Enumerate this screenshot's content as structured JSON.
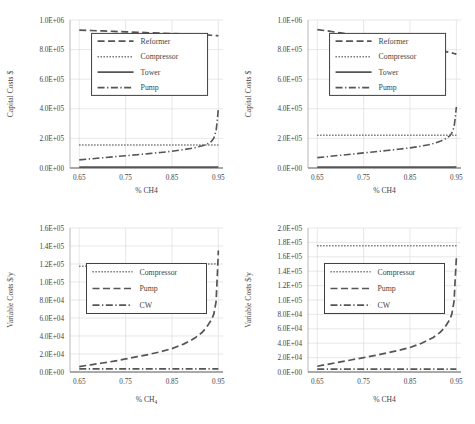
{
  "figure": {
    "panel_count": 4,
    "background": "#ffffff",
    "line_color": "#555555",
    "grid_color": "#d9d9d9",
    "axis_color": "#a6a6a6"
  },
  "chart_data": [
    {
      "id": "top-left",
      "type": "line",
      "title": "",
      "xlabel": "% CH4",
      "ylabel": "Capital Costs $",
      "xlim": [
        0.63,
        0.96
      ],
      "ylim": [
        0,
        1000000
      ],
      "xticks": [
        0.65,
        0.75,
        0.85,
        0.95
      ],
      "xticklabels": [
        "0.65",
        "0.75",
        "0.85",
        "0.95"
      ],
      "yticks": [
        0,
        200000,
        400000,
        600000,
        800000,
        1000000
      ],
      "yticklabels": [
        "0.0E+00",
        "2.0E+05",
        "4.0E+05",
        "6.0E+05",
        "8.0E+05",
        "1.0E+06"
      ],
      "grid": true,
      "legend_position": "upper-center",
      "legend": [
        "Reformer",
        "Compressor",
        "Tower",
        "Pump"
      ],
      "x": [
        0.65,
        0.675,
        0.7,
        0.725,
        0.75,
        0.775,
        0.8,
        0.825,
        0.85,
        0.875,
        0.89,
        0.9,
        0.915,
        0.925,
        0.935,
        0.94,
        0.945,
        0.948,
        0.95
      ],
      "series": [
        {
          "name": "Reformer",
          "dash": "dashed",
          "values": [
            932000,
            929000,
            926000,
            923000,
            920000,
            917000,
            914000,
            911000,
            908000,
            905000,
            903000,
            902000,
            900000,
            899000,
            897000,
            896000,
            895000,
            894000,
            893000
          ]
        },
        {
          "name": "Compressor",
          "dash": "dotted",
          "values": [
            155000,
            155000,
            155000,
            155000,
            155000,
            155000,
            155000,
            155000,
            155000,
            155000,
            155000,
            155000,
            155000,
            155000,
            155000,
            155000,
            155000,
            155000,
            155000
          ]
        },
        {
          "name": "Tower",
          "dash": "solid",
          "values": [
            6000,
            6000,
            6000,
            6000,
            6000,
            6000,
            6000,
            6000,
            6000,
            6000,
            6000,
            6000,
            6000,
            6000,
            6000,
            6000,
            6000,
            7000,
            8000
          ]
        },
        {
          "name": "Pump",
          "dash": "dashdot",
          "values": [
            55000,
            62000,
            69000,
            76000,
            83000,
            90000,
            97000,
            105000,
            113000,
            124000,
            132000,
            138000,
            150000,
            160000,
            180000,
            200000,
            250000,
            330000,
            405000
          ]
        }
      ]
    },
    {
      "id": "top-right",
      "type": "line",
      "title": "",
      "xlabel": "% CH4",
      "ylabel": "Capital Costs $",
      "xlim": [
        0.63,
        0.96
      ],
      "ylim": [
        0,
        1000000
      ],
      "xticks": [
        0.65,
        0.75,
        0.85,
        0.95
      ],
      "xticklabels": [
        "0.65",
        "0.75",
        "0.85",
        "0.95"
      ],
      "yticks": [
        0,
        200000,
        400000,
        600000,
        800000,
        1000000
      ],
      "yticklabels": [
        "0.0E+00",
        "2.0E+05",
        "4.0E+05",
        "6.0E+05",
        "8.0E+05",
        "1.0E+06"
      ],
      "grid": true,
      "legend_position": "upper-center",
      "legend": [
        "Reformer",
        "Compressor",
        "Tower",
        "Pump"
      ],
      "x": [
        0.65,
        0.675,
        0.7,
        0.725,
        0.75,
        0.775,
        0.8,
        0.825,
        0.85,
        0.875,
        0.89,
        0.9,
        0.915,
        0.925,
        0.935,
        0.94,
        0.945,
        0.948,
        0.95
      ],
      "series": [
        {
          "name": "Reformer",
          "dash": "dashed",
          "values": [
            935000,
            925000,
            913000,
            900000,
            887000,
            874000,
            861000,
            848000,
            834000,
            820000,
            811000,
            805000,
            795000,
            788000,
            781000,
            778000,
            774000,
            771000,
            768000
          ]
        },
        {
          "name": "Compressor",
          "dash": "dotted",
          "values": [
            222000,
            222000,
            222000,
            222000,
            222000,
            222000,
            222000,
            222000,
            222000,
            222000,
            222000,
            222000,
            222000,
            222000,
            222000,
            222000,
            222000,
            222000,
            222000
          ]
        },
        {
          "name": "Tower",
          "dash": "solid",
          "values": [
            6000,
            6000,
            6000,
            6000,
            6000,
            6000,
            6000,
            6000,
            6000,
            6000,
            6000,
            6000,
            6000,
            6000,
            6000,
            6000,
            6000,
            7000,
            8000
          ]
        },
        {
          "name": "Pump",
          "dash": "dashdot",
          "values": [
            70000,
            78000,
            86000,
            94000,
            102000,
            110000,
            118000,
            127000,
            136000,
            148000,
            157000,
            165000,
            180000,
            195000,
            215000,
            235000,
            275000,
            350000,
            412000
          ]
        }
      ]
    },
    {
      "id": "bottom-left",
      "type": "line",
      "title": "",
      "xlabel": "% CH₄",
      "ylabel": "Variable Costs $/y",
      "xlim": [
        0.63,
        0.96
      ],
      "ylim": [
        0,
        160000
      ],
      "xticks": [
        0.65,
        0.75,
        0.85,
        0.95
      ],
      "xticklabels": [
        "0.65",
        "0.75",
        "0.85",
        "0.95"
      ],
      "yticks": [
        0,
        20000,
        40000,
        60000,
        80000,
        100000,
        120000,
        140000,
        160000
      ],
      "yticklabels": [
        "0.0E+00",
        "2.0E+04",
        "4.0E+04",
        "6.0E+04",
        "8.0E+04",
        "1.0E+05",
        "1.2E+05",
        "1.4E+05",
        "1.6E+05"
      ],
      "grid": true,
      "legend_position": "center",
      "legend": [
        "Compressor",
        "Pump",
        "CW"
      ],
      "x": [
        0.65,
        0.675,
        0.7,
        0.725,
        0.75,
        0.775,
        0.8,
        0.825,
        0.85,
        0.875,
        0.89,
        0.9,
        0.915,
        0.925,
        0.935,
        0.94,
        0.945,
        0.948,
        0.95
      ],
      "series": [
        {
          "name": "Compressor",
          "dash": "dotted",
          "values": [
            117500,
            117700,
            117900,
            118100,
            118300,
            118500,
            118700,
            118900,
            119100,
            119300,
            119500,
            119600,
            119800,
            119900,
            120000,
            120100,
            120200,
            120300,
            120400
          ]
        },
        {
          "name": "Pump",
          "dash": "dashed",
          "values": [
            6000,
            8000,
            10000,
            12000,
            14500,
            17000,
            19500,
            22500,
            26000,
            31000,
            35000,
            38000,
            44000,
            50000,
            58000,
            64000,
            78000,
            110000,
            135000
          ]
        },
        {
          "name": "CW",
          "dash": "dashdot",
          "values": [
            3500,
            3500,
            3500,
            3500,
            3500,
            3500,
            3500,
            3500,
            3500,
            3500,
            3500,
            3500,
            3500,
            3500,
            3500,
            3500,
            3500,
            3500,
            3500
          ]
        }
      ]
    },
    {
      "id": "bottom-right",
      "type": "line",
      "title": "",
      "xlabel": "% CH4",
      "ylabel": "Variable Costs $/y",
      "xlim": [
        0.63,
        0.96
      ],
      "ylim": [
        0,
        200000
      ],
      "xticks": [
        0.65,
        0.75,
        0.85,
        0.95
      ],
      "xticklabels": [
        "0.65",
        "0.75",
        "0.85",
        "0.95"
      ],
      "yticks": [
        0,
        20000,
        40000,
        60000,
        80000,
        100000,
        120000,
        140000,
        160000,
        180000,
        200000
      ],
      "yticklabels": [
        "0.0E+00",
        "2.0E+04",
        "4.0E+04",
        "6.0E+04",
        "8.0E+04",
        "1.0E+05",
        "1.2E+05",
        "1.4E+05",
        "1.6E+05",
        "1.8E+05",
        "2.0E+05"
      ],
      "grid": true,
      "legend_position": "center",
      "legend": [
        "Compressor",
        "Pump",
        "CW"
      ],
      "x": [
        0.65,
        0.675,
        0.7,
        0.725,
        0.75,
        0.775,
        0.8,
        0.825,
        0.85,
        0.875,
        0.89,
        0.9,
        0.915,
        0.925,
        0.935,
        0.94,
        0.945,
        0.948,
        0.95
      ],
      "series": [
        {
          "name": "Compressor",
          "dash": "dotted",
          "values": [
            175500,
            175500,
            175500,
            175500,
            175500,
            175500,
            175500,
            175500,
            175500,
            175500,
            175500,
            175500,
            175500,
            175500,
            175500,
            175500,
            175500,
            175500,
            175500
          ]
        },
        {
          "name": "Pump",
          "dash": "dashed",
          "values": [
            8000,
            11000,
            14000,
            17000,
            20000,
            23000,
            26500,
            30000,
            34000,
            40000,
            44500,
            48000,
            55000,
            62000,
            72000,
            80000,
            98000,
            135000,
            158000
          ]
        },
        {
          "name": "CW",
          "dash": "dashdot",
          "values": [
            4000,
            4000,
            4000,
            4000,
            4000,
            4000,
            4000,
            4000,
            4000,
            4000,
            4000,
            4000,
            4000,
            4000,
            4000,
            4000,
            4000,
            4000,
            4000
          ]
        }
      ]
    }
  ]
}
